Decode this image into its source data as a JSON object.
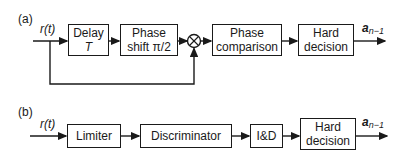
{
  "diagram_a": {
    "panel_label": "(a)",
    "input_label": "r(t)",
    "blocks": [
      {
        "id": "delay",
        "line1": "Delay",
        "line2": "T"
      },
      {
        "id": "phase-shift",
        "line1": "Phase",
        "line2": "shift π/2"
      },
      {
        "id": "multiplier",
        "symbol": "×"
      },
      {
        "id": "phase-comparison",
        "line1": "Phase",
        "line2": "comparison"
      },
      {
        "id": "hard-decision",
        "line1": "Hard",
        "line2": "decision"
      }
    ],
    "output_label": {
      "base": "a",
      "subscript": "n−1"
    }
  },
  "diagram_b": {
    "panel_label": "(b)",
    "input_label": "r(t)",
    "blocks": [
      {
        "id": "limiter",
        "line1": "Limiter"
      },
      {
        "id": "discriminator",
        "line1": "Discriminator"
      },
      {
        "id": "integrate-dump",
        "line1": "I&D"
      },
      {
        "id": "hard-decision",
        "line1": "Hard",
        "line2": "decision"
      }
    ],
    "output_label": {
      "base": "a",
      "subscript": "n−1"
    }
  },
  "colors": {
    "stroke": "#1a1a1a",
    "background": "#ffffff"
  }
}
